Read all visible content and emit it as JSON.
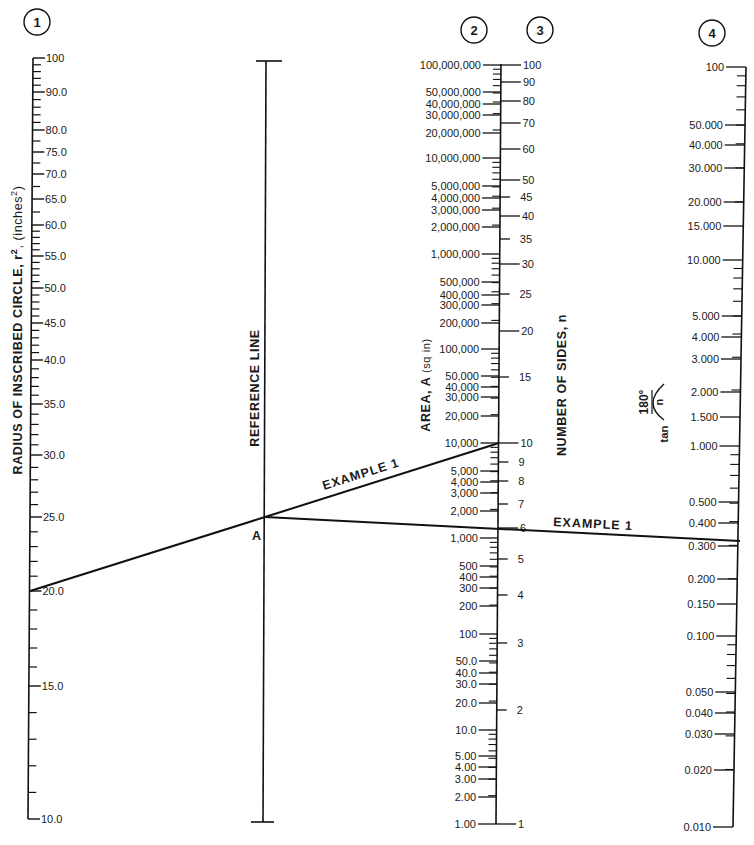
{
  "scale_numbers": [
    "1",
    "2",
    "3",
    "4"
  ],
  "axes": {
    "radius": {
      "title": "RADIUS OF INSCRIBED CIRCLE, r², (inches²)",
      "title_main": "RADIUS OF INSCRIBED CIRCLE, r",
      "title_sup": "2",
      "title_tail": ", (inches",
      "title_sup2": "2",
      "title_end": ")",
      "labels": [
        {
          "t": "100",
          "y": 58
        },
        {
          "t": "90.0",
          "y": 92
        },
        {
          "t": "80.0",
          "y": 130
        },
        {
          "t": "75.0",
          "y": 152
        },
        {
          "t": "70.0",
          "y": 174
        },
        {
          "t": "65.0",
          "y": 199
        },
        {
          "t": "60.0",
          "y": 225
        },
        {
          "t": "55.0",
          "y": 256
        },
        {
          "t": "50.0",
          "y": 288
        },
        {
          "t": "45.0",
          "y": 323
        },
        {
          "t": "40.0",
          "y": 360
        },
        {
          "t": "35.0",
          "y": 404
        },
        {
          "t": "30.0",
          "y": 455
        },
        {
          "t": "25.0",
          "y": 517
        },
        {
          "t": "20.0",
          "y": 591
        },
        {
          "t": "15.0",
          "y": 686
        },
        {
          "t": "10.0",
          "y": 819
        }
      ]
    },
    "reference": {
      "title": "REFERENCE LINE",
      "point_label": "A"
    },
    "area": {
      "title": "AREA, A (sq in)",
      "title_main": "AREA, A ",
      "title_unit": "(sq in)",
      "labels": [
        {
          "t": "100,000,000",
          "y": 65
        },
        {
          "t": "50,000,000",
          "y": 92
        },
        {
          "t": "40,000,000",
          "y": 104
        },
        {
          "t": "30,000,000",
          "y": 115
        },
        {
          "t": "20,000,000",
          "y": 133
        },
        {
          "t": "10,000,000",
          "y": 158
        },
        {
          "t": "5,000,000",
          "y": 186
        },
        {
          "t": "4,000,000",
          "y": 198
        },
        {
          "t": "3,000,000",
          "y": 210
        },
        {
          "t": "2,000,000",
          "y": 227
        },
        {
          "t": "1,000,000",
          "y": 254
        },
        {
          "t": "500,000",
          "y": 282
        },
        {
          "t": "400,000",
          "y": 295
        },
        {
          "t": "300,000",
          "y": 305
        },
        {
          "t": "200,000",
          "y": 323
        },
        {
          "t": "100,000",
          "y": 349
        },
        {
          "t": "50,000",
          "y": 376
        },
        {
          "t": "40,000",
          "y": 387
        },
        {
          "t": "30,000",
          "y": 397
        },
        {
          "t": "20,000",
          "y": 416
        },
        {
          "t": "10,000",
          "y": 443
        },
        {
          "t": "5,000",
          "y": 471
        },
        {
          "t": "4,000",
          "y": 482
        },
        {
          "t": "3,000",
          "y": 493
        },
        {
          "t": "2,000",
          "y": 511
        },
        {
          "t": "1,000",
          "y": 538
        },
        {
          "t": "500",
          "y": 566
        },
        {
          "t": "400",
          "y": 577
        },
        {
          "t": "300",
          "y": 588
        },
        {
          "t": "200",
          "y": 606
        },
        {
          "t": "100",
          "y": 634
        },
        {
          "t": "50.0",
          "y": 661
        },
        {
          "t": "40.0",
          "y": 673
        },
        {
          "t": "30.0",
          "y": 684
        },
        {
          "t": "20.0",
          "y": 703
        },
        {
          "t": "10.0",
          "y": 730
        },
        {
          "t": "5.00",
          "y": 756
        },
        {
          "t": "4.00",
          "y": 767
        },
        {
          "t": "3.00",
          "y": 779
        },
        {
          "t": "2.00",
          "y": 797
        },
        {
          "t": "1.00",
          "y": 824
        }
      ]
    },
    "sides": {
      "title": "NUMBER OF SIDES, n",
      "labels": [
        {
          "t": "100",
          "y": 65,
          "long": true
        },
        {
          "t": "90",
          "y": 82,
          "long": true
        },
        {
          "t": "80",
          "y": 101,
          "long": true
        },
        {
          "t": "70",
          "y": 123,
          "long": true
        },
        {
          "t": "60",
          "y": 149,
          "long": true
        },
        {
          "t": "50",
          "y": 180,
          "long": true
        },
        {
          "t": "45",
          "y": 197,
          "long": false
        },
        {
          "t": "40",
          "y": 216,
          "long": true
        },
        {
          "t": "35",
          "y": 239,
          "long": false
        },
        {
          "t": "30",
          "y": 264,
          "long": true
        },
        {
          "t": "25",
          "y": 294,
          "long": false
        },
        {
          "t": "20",
          "y": 331,
          "long": true
        },
        {
          "t": "15",
          "y": 377,
          "long": false
        },
        {
          "t": "10",
          "y": 443,
          "long": true
        },
        {
          "t": "9",
          "y": 462,
          "long": false
        },
        {
          "t": "8",
          "y": 481,
          "long": false
        },
        {
          "t": "7",
          "y": 504,
          "long": false
        },
        {
          "t": "6",
          "y": 528,
          "long": true
        },
        {
          "t": "5",
          "y": 559,
          "long": false
        },
        {
          "t": "4",
          "y": 595,
          "long": false
        },
        {
          "t": "3",
          "y": 643,
          "long": false
        },
        {
          "t": "2",
          "y": 710,
          "long": false
        },
        {
          "t": "1",
          "y": 824,
          "long": true
        }
      ]
    },
    "tan": {
      "title": "tan (180° / n)",
      "title_fn": "tan",
      "title_num": "180°",
      "title_den": "n",
      "labels": [
        {
          "t": "100",
          "y": 67
        },
        {
          "t": "50.000",
          "y": 125
        },
        {
          "t": "40.000",
          "y": 145
        },
        {
          "t": "30.000",
          "y": 168
        },
        {
          "t": "20.000",
          "y": 202
        },
        {
          "t": "15.000",
          "y": 226
        },
        {
          "t": "10.000",
          "y": 260
        },
        {
          "t": "5.000",
          "y": 316
        },
        {
          "t": "4.000",
          "y": 337
        },
        {
          "t": "3.000",
          "y": 359
        },
        {
          "t": "2.000",
          "y": 392
        },
        {
          "t": "1.500",
          "y": 417
        },
        {
          "t": "1.000",
          "y": 446
        },
        {
          "t": "0.500",
          "y": 502
        },
        {
          "t": "0.400",
          "y": 523
        },
        {
          "t": "0.300",
          "y": 546
        },
        {
          "t": "0.200",
          "y": 579
        },
        {
          "t": "0.150",
          "y": 604
        },
        {
          "t": "0.100",
          "y": 636
        },
        {
          "t": "0.050",
          "y": 692
        },
        {
          "t": "0.040",
          "y": 713
        },
        {
          "t": "0.030",
          "y": 734
        },
        {
          "t": "0.020",
          "y": 770
        },
        {
          "t": "0.010",
          "y": 827
        }
      ]
    }
  },
  "example": {
    "label": "EXAMPLE 1",
    "segment1": {
      "from": "r² = 20.0",
      "through": "A",
      "to": "A = 10,000 sq in / n = 10"
    },
    "segment2": {
      "from": "A",
      "through": "n = 6",
      "to": "tan(180°/n) ≈ 0.300"
    }
  },
  "chart_data": {
    "type": "nomogram",
    "title": "",
    "scales": [
      {
        "id": 1,
        "name": "Radius of inscribed circle, r² (inches²)",
        "range": [
          10,
          100
        ],
        "ticks": [
          100,
          90,
          80,
          75,
          70,
          65,
          60,
          55,
          50,
          45,
          40,
          35,
          30,
          25,
          20,
          15,
          10
        ]
      },
      {
        "id": "ref",
        "name": "Reference line",
        "point": "A"
      },
      {
        "id": 2,
        "name": "Area, A (sq in)",
        "range": [
          1,
          100000000
        ],
        "scale": "log",
        "ticks": [
          100000000,
          50000000,
          40000000,
          30000000,
          20000000,
          10000000,
          5000000,
          4000000,
          3000000,
          2000000,
          1000000,
          500000,
          400000,
          300000,
          200000,
          100000,
          50000,
          40000,
          30000,
          20000,
          10000,
          5000,
          4000,
          3000,
          2000,
          1000,
          500,
          400,
          300,
          200,
          100,
          50,
          40,
          30,
          20,
          10,
          5,
          4,
          3,
          2,
          1
        ]
      },
      {
        "id": 3,
        "name": "Number of sides, n",
        "range": [
          1,
          100
        ],
        "ticks": [
          100,
          90,
          80,
          70,
          60,
          50,
          45,
          40,
          35,
          30,
          25,
          20,
          15,
          10,
          9,
          8,
          7,
          6,
          5,
          4,
          3,
          2,
          1
        ]
      },
      {
        "id": 4,
        "name": "tan(180°/n)",
        "range": [
          0.01,
          100
        ],
        "scale": "log",
        "ticks": [
          100,
          50,
          40,
          30,
          20,
          15,
          10,
          5,
          4,
          3,
          2,
          1.5,
          1,
          0.5,
          0.4,
          0.3,
          0.2,
          0.15,
          0.1,
          0.05,
          0.04,
          0.03,
          0.02,
          0.01
        ]
      }
    ],
    "example_1": {
      "r_squared": 20.0,
      "area_sq_in": 10000,
      "n_at_area": 10,
      "n_second_line": 6,
      "tan_value": 0.31,
      "reference_point": "A"
    }
  }
}
